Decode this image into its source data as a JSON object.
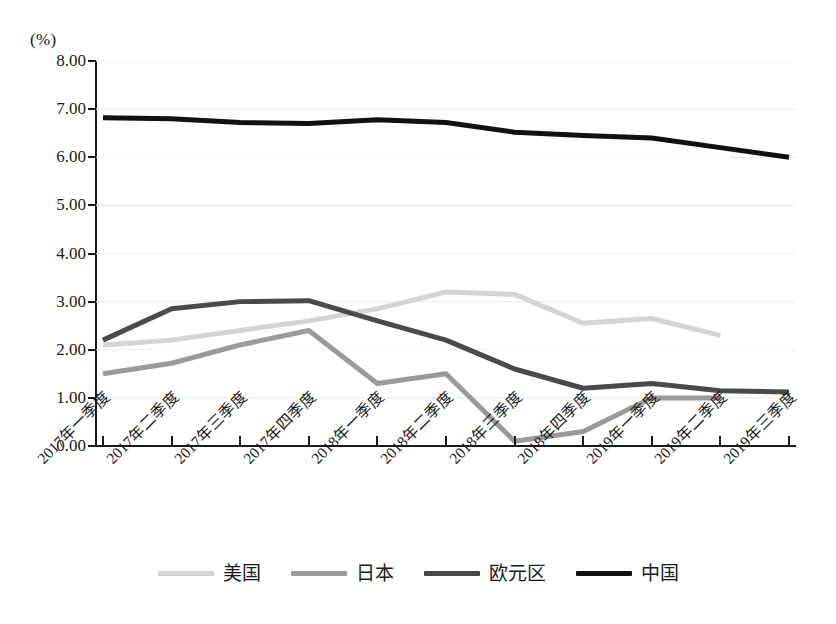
{
  "unit_label": "(%)",
  "legend": {
    "position": "bottom-center",
    "items": [
      {
        "label": "美国",
        "color": "#d4d4d4"
      },
      {
        "label": "日本",
        "color": "#9a9a9a"
      },
      {
        "label": "欧元区",
        "color": "#4a4a4a"
      },
      {
        "label": "中国",
        "color": "#111111"
      }
    ]
  },
  "axis": {
    "y_ticks": [
      "8.00",
      "7.00",
      "6.00",
      "5.00",
      "4.00",
      "3.00",
      "2.00",
      "1.00",
      "0.00"
    ],
    "y_min": 0,
    "y_max": 8,
    "y_step": 1,
    "grid": true
  },
  "chart_data": {
    "type": "line",
    "title": "",
    "subtitle": "",
    "xlabel": "",
    "ylabel": "(%)",
    "ylim": [
      0,
      8
    ],
    "ytick_step": 1,
    "grid": true,
    "legend_position": "bottom-center",
    "categories": [
      "2017年一季度",
      "2017年二季度",
      "2017年三季度",
      "2017年四季度",
      "2018年一季度",
      "2018年二季度",
      "2018年三季度",
      "2018年四季度",
      "2019年一季度",
      "2019年二季度",
      "2019年三季度"
    ],
    "series": [
      {
        "name": "美国",
        "color": "#d4d4d4",
        "values": [
          2.1,
          2.2,
          2.4,
          2.6,
          2.85,
          3.2,
          3.15,
          2.55,
          2.65,
          2.3,
          null
        ]
      },
      {
        "name": "日本",
        "color": "#9a9a9a",
        "values": [
          1.5,
          1.72,
          2.1,
          2.4,
          1.3,
          1.5,
          0.1,
          0.3,
          1.0,
          1.0,
          null
        ]
      },
      {
        "name": "欧元区",
        "color": "#4a4a4a",
        "values": [
          2.2,
          2.85,
          3.0,
          3.02,
          2.6,
          2.2,
          1.6,
          1.2,
          1.3,
          1.15,
          1.12
        ]
      },
      {
        "name": "中国",
        "color": "#111111",
        "values": [
          6.82,
          6.8,
          6.72,
          6.7,
          6.78,
          6.72,
          6.52,
          6.45,
          6.4,
          6.2,
          6.0
        ]
      }
    ]
  }
}
